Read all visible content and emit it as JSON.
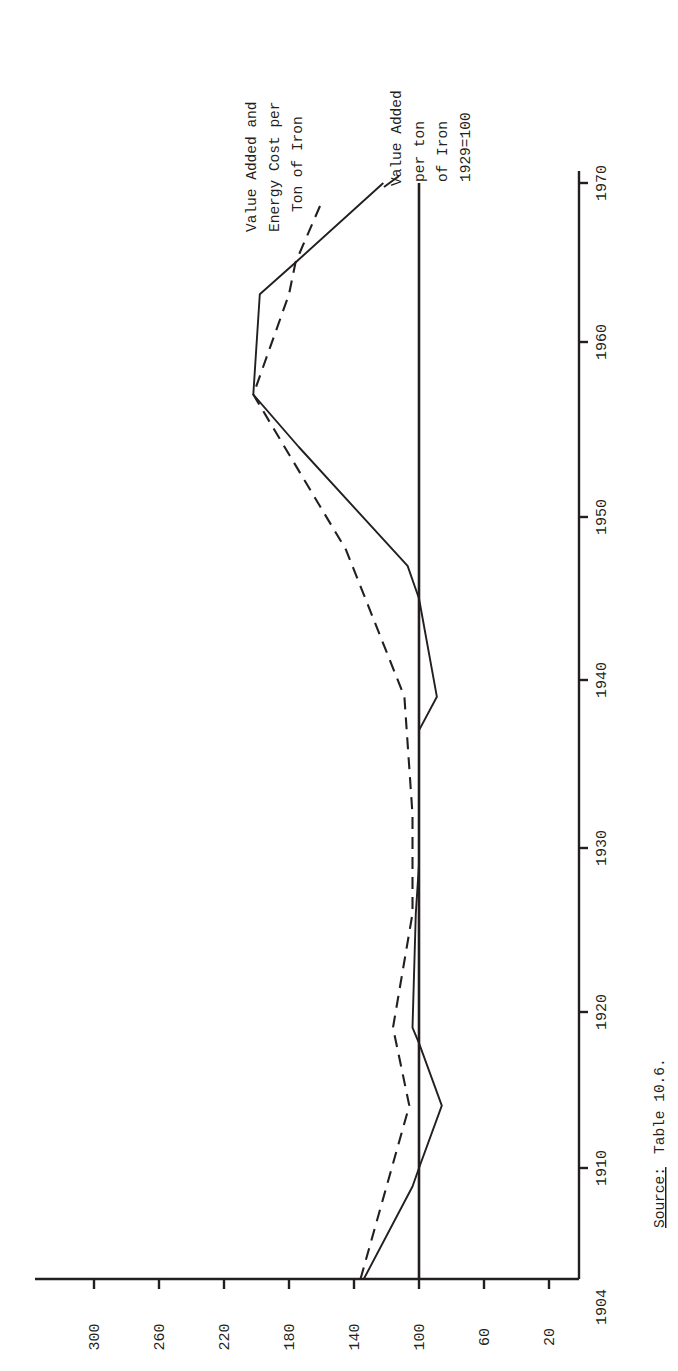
{
  "chart_data": {
    "type": "line",
    "orientation": "rotated-90-ccw",
    "title": "",
    "xlabel": "Year",
    "ylabel": "Index (1929=100)",
    "x_ticks": [
      1904,
      1910,
      1920,
      1930,
      1940,
      1950,
      1960,
      1970
    ],
    "y_ticks": [
      20,
      60,
      100,
      140,
      180,
      220,
      260,
      300
    ],
    "xlim": [
      1904,
      1970
    ],
    "ylim": [
      0,
      320
    ],
    "grid": false,
    "reference_line": {
      "value": 100,
      "label": "1929=100"
    },
    "series": [
      {
        "name": "Value Added per ton of Iron 1929=100",
        "style": "solid",
        "x": [
          1904,
          1909,
          1910,
          1914,
          1918,
          1919,
          1926,
          1929,
          1937,
          1939,
          1945,
          1947,
          1954,
          1957,
          1963,
          1965,
          1970
        ],
        "values": [
          134,
          104,
          100,
          86,
          100,
          104,
          102,
          100,
          100,
          89,
          100,
          107,
          174,
          202,
          198,
          176,
          122
        ]
      },
      {
        "name": "Value Added and Energy Cost per Ton of Iron",
        "style": "dashed",
        "x": [
          1904,
          1914,
          1919,
          1926,
          1932,
          1939,
          1948,
          1957,
          1963,
          1965,
          1969
        ],
        "values": [
          136,
          106,
          116,
          104,
          104,
          109,
          145,
          202,
          180,
          176,
          159
        ]
      }
    ],
    "annotations": [
      "Value Added and Energy Cost per Ton of Iron",
      "Value Added per ton of Iron 1929=100"
    ]
  },
  "legend": {
    "dashed_lines": [
      "Value Added and",
      "Energy Cost per",
      "Ton of Iron"
    ],
    "solid_lines": [
      "Value Added",
      "per ton",
      "of Iron",
      "1929=100"
    ]
  },
  "source": {
    "label": "Source:",
    "text": "Table 10.6."
  }
}
